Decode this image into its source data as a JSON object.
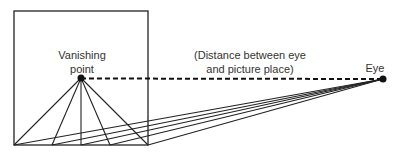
{
  "diagram": {
    "labels": {
      "vanishing_point": [
        "Vanishing",
        "point"
      ],
      "distance": [
        "(Distance between eye",
        "and picture place)"
      ],
      "eye": "Eye"
    },
    "colors": {
      "stroke": "#222222",
      "text": "#333333",
      "background": "#ffffff"
    },
    "geometry": {
      "picture_plane": {
        "x": 14,
        "y": 11,
        "width": 134,
        "height": 134
      },
      "vanishing_point": {
        "x": 81,
        "y": 78
      },
      "eye": {
        "x": 383,
        "y": 79
      },
      "base_points_x": [
        14,
        52,
        81,
        110,
        148
      ]
    }
  }
}
